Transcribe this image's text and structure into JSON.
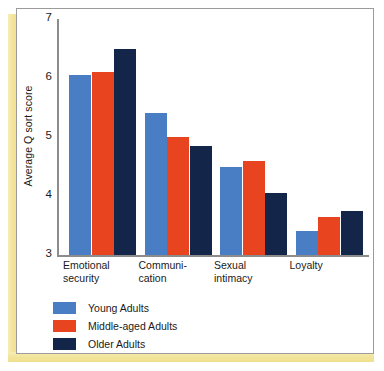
{
  "chart_data": {
    "type": "bar",
    "title": "",
    "xlabel": "",
    "ylabel": "Average Q sort score",
    "ylim": [
      3,
      7
    ],
    "yticks": [
      3,
      4,
      5,
      6,
      7
    ],
    "ytick_labels": [
      "3",
      "4",
      "5",
      "6",
      "7"
    ],
    "grid": false,
    "legend_position": "below-left",
    "categories": [
      "Emotional\nsecurity",
      "Communi-\ncation",
      "Sexual\nintimacy",
      "Loyalty"
    ],
    "series": [
      {
        "name": "Young Adults",
        "color": "#4a7ec4",
        "values": [
          6.05,
          5.4,
          4.5,
          3.4
        ]
      },
      {
        "name": "Middle-aged Adults",
        "color": "#e8441f",
        "values": [
          6.1,
          5.0,
          4.6,
          3.65
        ]
      },
      {
        "name": "Older Adults",
        "color": "#132549",
        "values": [
          6.5,
          4.85,
          4.05,
          3.75
        ]
      }
    ]
  },
  "figure": {
    "frame_color": "#9b9b9b",
    "page_edge_color": "#f2e39a",
    "background_color": "#ffffff"
  }
}
